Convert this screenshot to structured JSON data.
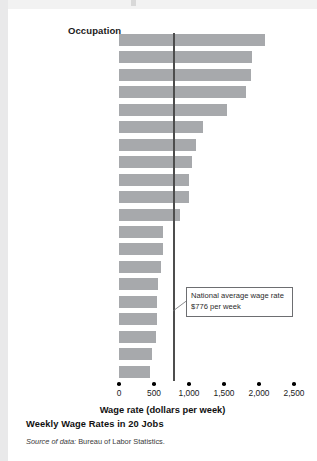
{
  "header": {
    "occupation_label": "Occupation"
  },
  "callout": {
    "text": "National average wage rate $776 per week"
  },
  "footer": {
    "figure_title": "Weekly Wage Rates in 20 Jobs",
    "source_prefix": "Source of data:",
    "source_body": "Bureau of Labor Statistics."
  },
  "colors": {
    "bar": "#a7a9ac",
    "average_line": "#4d4d4d",
    "text": "#231f20",
    "callout_border": "#6d6e71",
    "page_band": "#e9e9ea"
  },
  "chart_data": {
    "type": "bar",
    "orientation": "horizontal",
    "title": "Weekly Wage Rates in 20 Jobs",
    "xlabel": "Wage rate (dollars per week)",
    "ylabel": "Occupation",
    "xlim": [
      0,
      2500
    ],
    "xticks": [
      0,
      500,
      1000,
      1500,
      2000,
      2500
    ],
    "xtick_labels": [
      "0",
      "500",
      "1,000",
      "1,500",
      "2,000",
      "2,500"
    ],
    "grid": false,
    "legend": null,
    "annotations": [
      {
        "type": "reference-line",
        "axis": "x",
        "value": 776,
        "label": "National average wage rate $776 per week"
      }
    ],
    "categories": [
      "Chief executives",
      "Physicians and surgeons",
      "Lawyers",
      "Aircraft pilots",
      "Dentists",
      "Computer programmers",
      "College teachers",
      "Registered nurses",
      "High-school teachers",
      "Police officers",
      "Flight attendants",
      "Retail salespersons",
      "Construction laborers",
      "Bus drivers",
      "Taxi drivers",
      "Bartenders",
      "Tellers",
      "Hairdressers",
      "Parking-lot attendants",
      "Fast-food workers"
    ],
    "values": [
      2086,
      1900,
      1886,
      1814,
      1543,
      1200,
      1100,
      1043,
      1000,
      1000,
      871,
      629,
      629,
      600,
      557,
      543,
      543,
      529,
      471,
      443
    ],
    "value_unit": "dollars per week"
  }
}
